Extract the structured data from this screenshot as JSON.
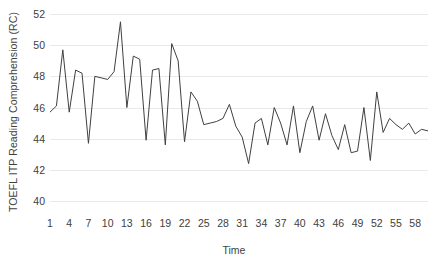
{
  "chart_data": {
    "type": "line",
    "title": "",
    "xlabel": "Time",
    "ylabel": "TOEFL ITP Reading Comprehension (RC)",
    "ylim": [
      40,
      52
    ],
    "xlim": [
      1,
      60
    ],
    "grid": true,
    "legend": null,
    "line_color": "#404040",
    "background_color": "#ffffff",
    "gridline_color": "#e9e9e9",
    "y_ticks": [
      40,
      42,
      44,
      46,
      48,
      50,
      52
    ],
    "x_ticks": [
      1,
      4,
      7,
      10,
      13,
      16,
      19,
      22,
      25,
      28,
      31,
      34,
      37,
      40,
      43,
      46,
      49,
      52,
      55,
      58
    ],
    "x": [
      1,
      2,
      3,
      4,
      5,
      6,
      7,
      8,
      9,
      10,
      11,
      12,
      13,
      14,
      15,
      16,
      17,
      18,
      19,
      20,
      21,
      22,
      23,
      24,
      25,
      26,
      27,
      28,
      29,
      30,
      31,
      32,
      33,
      34,
      35,
      36,
      37,
      38,
      39,
      40,
      41,
      42,
      43,
      44,
      45,
      46,
      47,
      48,
      49,
      50,
      51,
      52,
      53,
      54,
      55,
      56,
      57,
      58,
      59,
      60
    ],
    "values": [
      45.7,
      46.1,
      49.7,
      45.7,
      48.4,
      48.2,
      43.7,
      48.0,
      47.9,
      47.8,
      48.3,
      51.5,
      46.0,
      49.3,
      49.1,
      43.9,
      48.4,
      48.5,
      43.6,
      50.1,
      49.0,
      43.8,
      47.0,
      46.4,
      44.9,
      45.0,
      45.1,
      45.3,
      46.2,
      44.8,
      44.1,
      42.4,
      45.0,
      45.3,
      43.6,
      46.0,
      45.0,
      43.6,
      46.1,
      43.1,
      45.1,
      46.1,
      43.9,
      45.6,
      44.2,
      43.3,
      44.9,
      43.1,
      43.2,
      46.0,
      42.6,
      47.0,
      44.4,
      45.3,
      44.9,
      44.6,
      45.0,
      44.3,
      44.6,
      44.5
    ]
  }
}
